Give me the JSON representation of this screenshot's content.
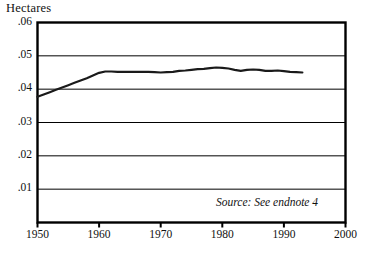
{
  "figure": {
    "y_axis_title": "Hectares",
    "source_note": "Source: See endnote 4",
    "line_color": "#1a1a1a",
    "axis_color": "#000000",
    "grid_color": "#000000",
    "background": "#ffffff"
  },
  "chart_data": {
    "type": "line",
    "title": "",
    "subtitle": "",
    "xlabel": "",
    "ylabel": "Hectares",
    "xlim": [
      1950,
      2000
    ],
    "ylim": [
      0,
      0.06
    ],
    "grid": true,
    "legend": null,
    "x_ticks": [
      1950,
      1960,
      1970,
      1980,
      1990,
      2000
    ],
    "x_tick_labels": [
      "1950",
      "1960",
      "1970",
      "1980",
      "1990",
      "2000"
    ],
    "y_ticks": [
      0.01,
      0.02,
      0.03,
      0.04,
      0.05,
      0.06
    ],
    "y_tick_labels": [
      ".01",
      ".02",
      ".03",
      ".04",
      ".05",
      ".06"
    ],
    "annotations": [
      "Source: See endnote 4"
    ],
    "series": [
      {
        "name": "Grain harvested area per person",
        "x": [
          1950,
          1951,
          1952,
          1953,
          1954,
          1955,
          1956,
          1957,
          1958,
          1959,
          1960,
          1961,
          1962,
          1963,
          1964,
          1965,
          1966,
          1967,
          1968,
          1969,
          1970,
          1971,
          1972,
          1973,
          1974,
          1975,
          1976,
          1977,
          1978,
          1979,
          1980,
          1981,
          1982,
          1983,
          1984,
          1985,
          1986,
          1987,
          1988,
          1989,
          1990,
          1991,
          1992,
          1993
        ],
        "values": [
          0.0377,
          0.0384,
          0.0391,
          0.0398,
          0.0405,
          0.0412,
          0.0419,
          0.0426,
          0.0433,
          0.0441,
          0.0449,
          0.0453,
          0.0453,
          0.0452,
          0.0452,
          0.0452,
          0.0452,
          0.0452,
          0.0452,
          0.0451,
          0.045,
          0.0451,
          0.0452,
          0.0455,
          0.0456,
          0.0458,
          0.046,
          0.0461,
          0.0463,
          0.0465,
          0.0464,
          0.0462,
          0.0458,
          0.0455,
          0.0458,
          0.0459,
          0.0458,
          0.0455,
          0.0455,
          0.0456,
          0.0454,
          0.0452,
          0.0451,
          0.045
        ]
      }
    ]
  }
}
